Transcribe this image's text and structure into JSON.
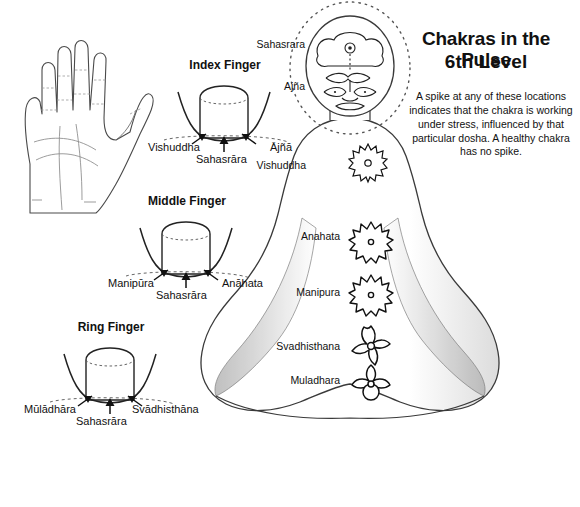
{
  "header": {
    "title": "Chakras in the Pulse",
    "subtitle": "6th Level",
    "description": "A spike at any of these locations indicates that the chakra is working under stress, influenced by that particular dosha. A healthy chakra has no spike."
  },
  "figure": {
    "name": "seated-meditating-figure",
    "chakra_labels": [
      {
        "key": "sahasrara",
        "label": "Sahasrara"
      },
      {
        "key": "ajna",
        "label": "Ajña"
      },
      {
        "key": "vishuddha",
        "label": "Vishuddha"
      },
      {
        "key": "anahata",
        "label": "Anahata"
      },
      {
        "key": "manipura",
        "label": "Manipura"
      },
      {
        "key": "svadhisthana",
        "label": "Svadhisthana"
      },
      {
        "key": "muladhara",
        "label": "Muladhara"
      }
    ]
  },
  "hand": {
    "name": "open-palm-hand"
  },
  "finger_diagrams": [
    {
      "key": "index",
      "title": "Index Finger",
      "left_label": "Vishuddha",
      "center_label": "Sahasrāra",
      "right_label": "Ājñā"
    },
    {
      "key": "middle",
      "title": "Middle Finger",
      "left_label": "Manipūra",
      "center_label": "Sahasrāra",
      "right_label": "Anāhata"
    },
    {
      "key": "ring",
      "title": "Ring Finger",
      "left_label": "Mūlādhāra",
      "center_label": "Sahasrāra",
      "right_label": "Svādhisthāna"
    }
  ],
  "colors": {
    "ink": "#111111",
    "outline": "#3a3a3a",
    "shade": "#c9c9c9",
    "background": "#ffffff"
  }
}
